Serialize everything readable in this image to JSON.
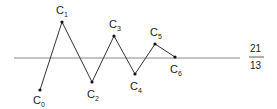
{
  "diagram": {
    "type": "zigzag-convergence",
    "axis_line": {
      "x1": 14,
      "x2": 240,
      "y": 58,
      "color": "#888888"
    },
    "limit_value": {
      "numerator": "21",
      "denominator": "13"
    },
    "points": [
      {
        "name": "C",
        "sub": "0",
        "x": 40,
        "y": 90,
        "lx": 33,
        "ly": 104
      },
      {
        "name": "C",
        "sub": "1",
        "x": 62,
        "y": 22,
        "lx": 56,
        "ly": 14
      },
      {
        "name": "C",
        "sub": "2",
        "x": 92,
        "y": 82,
        "lx": 87,
        "ly": 98
      },
      {
        "name": "C",
        "sub": "3",
        "x": 114,
        "y": 36,
        "lx": 109,
        "ly": 28
      },
      {
        "name": "C",
        "sub": "4",
        "x": 135,
        "y": 74,
        "lx": 130,
        "ly": 90
      },
      {
        "name": "C",
        "sub": "5",
        "x": 155,
        "y": 44,
        "lx": 150,
        "ly": 36
      },
      {
        "name": "C",
        "sub": "6",
        "x": 175,
        "y": 57,
        "lx": 170,
        "ly": 73
      }
    ],
    "line_color": "#333333"
  }
}
